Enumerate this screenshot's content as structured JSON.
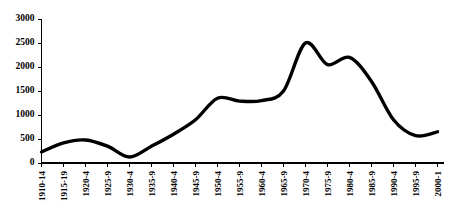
{
  "chart_data": {
    "type": "line",
    "title": "",
    "subtitle": "",
    "xlabel": "",
    "ylabel": "",
    "grid": false,
    "legend": false,
    "legend_position": "none",
    "line_color": "#000000",
    "background_color": "#ffffff",
    "axis_color": "#000000",
    "ylim": [
      0,
      3000
    ],
    "yticks": [
      "0",
      "500",
      "1000",
      "1500",
      "2000",
      "2500",
      "3000"
    ],
    "ytick_values": [
      0,
      500,
      1000,
      1500,
      2000,
      2500,
      3000
    ],
    "categories": [
      "1910-14",
      "1915-19",
      "1920-4",
      "1925-9",
      "1930-4",
      "1935-9",
      "1940-4",
      "1945-9",
      "1950-4",
      "1955-9",
      "1960-4",
      "1965-9",
      "1970-4",
      "1975-9",
      "1980-4",
      "1985-9",
      "1990-4",
      "1995-9",
      "2000-1"
    ],
    "series": [
      {
        "name": "value",
        "values": [
          230,
          420,
          480,
          350,
          125,
          350,
          600,
          900,
          1350,
          1290,
          1300,
          1500,
          2500,
          2050,
          2200,
          1700,
          900,
          570,
          650
        ]
      }
    ]
  }
}
